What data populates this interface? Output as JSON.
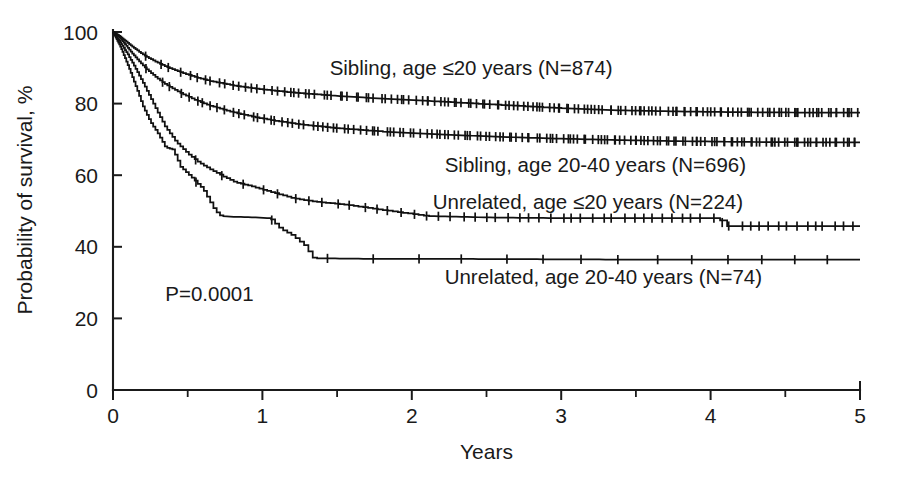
{
  "chart_data": {
    "type": "line",
    "subtype": "kaplan-meier-survival",
    "title": "",
    "xlabel": "Years",
    "ylabel": "Probability of survival, %",
    "xlim": [
      0,
      5
    ],
    "ylim": [
      0,
      100
    ],
    "xticks": [
      0,
      1,
      2,
      3,
      4,
      5
    ],
    "xtick_labels": [
      "0",
      "1",
      "2",
      "3",
      "4",
      "5"
    ],
    "xticks_minor": [
      0.5,
      1.5,
      2.5,
      3.5,
      4.5
    ],
    "yticks": [
      0,
      20,
      40,
      60,
      80,
      100
    ],
    "ytick_labels": [
      "0",
      "20",
      "40",
      "60",
      "80",
      "100"
    ],
    "grid": false,
    "legend_position": "inline-annotations",
    "annotations": [
      {
        "text": "P=0.0001",
        "x": 0.35,
        "y": 25
      }
    ],
    "series": [
      {
        "name": "Sibling, age ≤20 years (N=874)",
        "group": "Sibling",
        "age_group": "≤20 years",
        "n": 874,
        "label_x": 1.45,
        "label_y": 88,
        "final_survival": 77.5,
        "x": [
          0,
          0.04,
          0.08,
          0.12,
          0.17,
          0.22,
          0.28,
          0.35,
          0.45,
          0.55,
          0.65,
          0.8,
          0.95,
          1.1,
          1.25,
          1.45,
          1.6,
          1.8,
          2.0,
          2.3,
          2.6,
          3.0,
          3.4,
          3.8,
          4.2,
          4.6,
          5.0
        ],
        "y": [
          100,
          99.0,
          97.6,
          96.2,
          94.6,
          93.2,
          91.8,
          90.4,
          88.8,
          87.4,
          86.3,
          85.1,
          84.2,
          83.5,
          82.9,
          82.3,
          81.9,
          81.4,
          81.0,
          80.3,
          79.6,
          78.7,
          78.1,
          77.8,
          77.6,
          77.5,
          77.5
        ]
      },
      {
        "name": "Sibling, age 20-40 years (N=696)",
        "group": "Sibling",
        "age_group": "20-40 years",
        "n": 696,
        "label_x": 2.22,
        "label_y": 61,
        "final_survival": 69.2,
        "x": [
          0,
          0.04,
          0.08,
          0.12,
          0.17,
          0.22,
          0.28,
          0.35,
          0.45,
          0.55,
          0.65,
          0.8,
          0.95,
          1.1,
          1.25,
          1.45,
          1.6,
          1.8,
          2.0,
          2.3,
          2.6,
          3.0,
          3.4,
          3.8,
          4.2,
          4.6,
          5.0
        ],
        "y": [
          100,
          98.6,
          96.6,
          94.4,
          92.0,
          89.8,
          87.6,
          85.4,
          83.0,
          81.0,
          79.4,
          77.6,
          76.2,
          75.1,
          74.2,
          73.3,
          72.8,
          72.2,
          71.8,
          71.2,
          70.7,
          70.2,
          69.8,
          69.5,
          69.3,
          69.2,
          69.2
        ]
      },
      {
        "name": "Unrelated, age ≤20 years (N=224)",
        "group": "Unrelated",
        "age_group": "≤20 years",
        "n": 224,
        "label_x": 2.14,
        "label_y": 50.5,
        "final_survival": 45.8,
        "drop_at_year": 4.1,
        "x": [
          0,
          0.05,
          0.1,
          0.15,
          0.2,
          0.25,
          0.3,
          0.35,
          0.42,
          0.5,
          0.58,
          0.66,
          0.74,
          0.82,
          0.9,
          1.0,
          1.1,
          1.2,
          1.35,
          1.55,
          1.75,
          2.1,
          2.5,
          3.0,
          3.5,
          4.05,
          4.1,
          4.6,
          5.0
        ],
        "y": [
          100,
          97.0,
          93.6,
          89.8,
          85.8,
          81.6,
          77.4,
          73.4,
          69.4,
          66.0,
          63.4,
          61.4,
          59.6,
          58.0,
          57.2,
          56.0,
          54.8,
          53.6,
          52.6,
          51.8,
          50.6,
          48.6,
          48.2,
          48.0,
          48.0,
          48.0,
          45.8,
          45.8,
          45.8
        ]
      },
      {
        "name": "Unrelated, age 20-40 years (N=74)",
        "group": "Unrelated",
        "age_group": "20-40 years",
        "n": 74,
        "label_x": 2.22,
        "label_y": 29.5,
        "final_survival": 36.4,
        "x": [
          0,
          0.05,
          0.1,
          0.15,
          0.2,
          0.25,
          0.3,
          0.35,
          0.4,
          0.45,
          0.52,
          0.6,
          0.68,
          0.72,
          0.8,
          0.95,
          1.05,
          1.12,
          1.2,
          1.28,
          1.34,
          1.8,
          2.4,
          3.0,
          3.6,
          4.2,
          5.0
        ],
        "y": [
          100,
          95.8,
          90.6,
          85.0,
          79.2,
          74.8,
          71.6,
          67.8,
          67.2,
          62.4,
          59.6,
          56.2,
          50.2,
          48.6,
          48.4,
          48.2,
          48.0,
          45.0,
          43.2,
          40.4,
          36.8,
          36.6,
          36.6,
          36.5,
          36.4,
          36.4,
          36.4
        ]
      }
    ]
  },
  "axes": {
    "y_axis_title": "Probability of survival, %",
    "x_axis_title": "Years"
  }
}
